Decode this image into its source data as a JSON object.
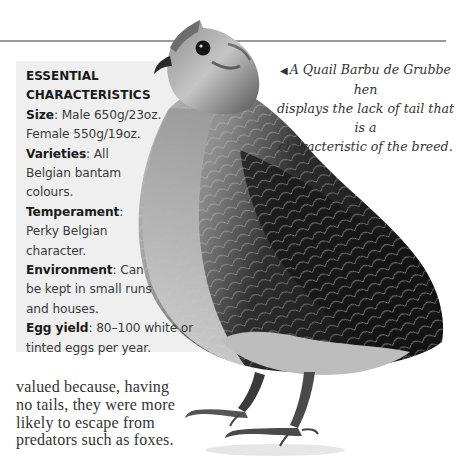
{
  "caption": {
    "arrow_icon": "◀",
    "lines": [
      "A Quail Barbu de Grubbe hen",
      "displays the lack of tail that is a",
      "characteristic of the breed."
    ]
  },
  "essentials": {
    "heading_lines": [
      "ESSENTIAL",
      "CHARACTERISTICS"
    ],
    "size": {
      "label": "Size",
      "lines": [
        ": Male 650g/23oz.",
        "Female 550g/19oz."
      ]
    },
    "varieties": {
      "label": "Varieties",
      "lines": [
        ": All",
        "Belgian bantam",
        "colours."
      ]
    },
    "temperament": {
      "label": "Temperament",
      "lines": [
        ":",
        "Perky Belgian",
        "character."
      ]
    },
    "environment": {
      "label": "Environment",
      "lines": [
        ": Can",
        "be kept in small runs",
        "and houses."
      ]
    },
    "egg_yield": {
      "label": "Egg yield",
      "lines": [
        ": 80–100 white or",
        "tinted eggs per year."
      ]
    }
  },
  "body_text": {
    "lines": [
      "valued because, having",
      "no tails, they were more",
      "likely to escape from",
      "predators such as foxes."
    ]
  },
  "image": {
    "subject": "Quail Barbu de Grubbe hen photograph"
  }
}
